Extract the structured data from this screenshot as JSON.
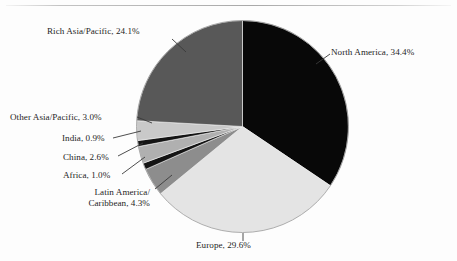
{
  "figure": {
    "background": "#fdfdfd",
    "has_top_rule": true
  },
  "chart_data": {
    "type": "pie",
    "title": "",
    "subtitle": "",
    "xlabel": "",
    "ylabel": "",
    "legend_position": "none",
    "labels_outside": true,
    "start_angle_deg": 0,
    "direction": "clockwise",
    "total_percent": 99.9,
    "categories": [
      "North America",
      "Europe",
      "Latin America/Caribbean",
      "Africa",
      "China",
      "India",
      "Other Asia/Pacific",
      "Rich Asia/Pacific"
    ],
    "values": [
      34.4,
      29.6,
      4.3,
      1.0,
      2.6,
      0.9,
      3.0,
      24.1
    ],
    "colors": [
      "#080808",
      "#e4e4e4",
      "#8d8d8d",
      "#141414",
      "#b0b0b0",
      "#141414",
      "#c9c9c9",
      "#585858"
    ],
    "slice_label_text": [
      "North America, 34.4%",
      "Europe, 29.6%",
      "Latin America/ Caribbean, 4.3%",
      "Africa, 1.0%",
      "China, 2.6%",
      "India, 0.9%",
      "Other Asia/Pacific, 3.0%",
      "Rich Asia/Pacific, 24.1%"
    ]
  },
  "labels": {
    "rich_asia_pacific": "Rich Asia/Pacific, 24.1%",
    "north_america": "North America, 34.4%",
    "other_asia_pacific": "Other Asia/Pacific, 3.0%",
    "india": "India, 0.9%",
    "china": "China, 2.6%",
    "africa": "Africa, 1.0%",
    "latin_america_line1": "Latin America/",
    "latin_america_line2": "Caribbean, 4.3%",
    "europe": "Europe, 29.6%"
  }
}
